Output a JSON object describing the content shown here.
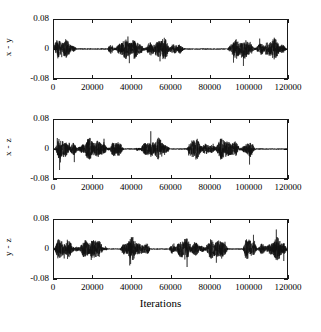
{
  "figure": {
    "background": "#ffffff",
    "trace_color": "#111111",
    "axis_color": "#1a1a1a",
    "xlabel": "Iterations"
  },
  "chart_data": {
    "type": "line",
    "title": "",
    "xlabel": "Iterations",
    "ylabel": "",
    "xlim": [
      0,
      120000
    ],
    "ylim": [
      -0.08,
      0.08
    ],
    "grid": false,
    "legend": "none",
    "xticks": [
      0,
      20000,
      40000,
      60000,
      80000,
      100000,
      120000
    ],
    "xticklabels": [
      "0",
      "20000",
      "40000",
      "60000",
      "80000",
      "100000",
      "120000"
    ],
    "yticks": [
      -0.08,
      0,
      0.08
    ],
    "yticklabels": [
      "-0.08",
      "0",
      "0.08"
    ],
    "panels": [
      {
        "ylabel": "x - y",
        "ylim": [
          -0.08,
          0.08
        ],
        "yticklabels": [
          "0.08",
          "0",
          "-0.08"
        ],
        "description": "synchronization error x minus y versus iterations; intermittent bursts of noise separated by near-zero quiet intervals",
        "active_intervals": [
          [
            0,
            12000
          ],
          [
            27000,
            68000
          ],
          [
            89000,
            120000
          ]
        ],
        "quiet_intervals": [
          [
            12000,
            27000
          ],
          [
            68000,
            89000
          ]
        ],
        "peak_amplitude": 0.055,
        "typical_amplitude": 0.03
      },
      {
        "ylabel": "x - z",
        "ylim": [
          -0.08,
          0.08
        ],
        "yticklabels": [
          "0.08",
          "0",
          "-0.08"
        ],
        "description": "synchronization error x minus z versus iterations; bursts with quiet gaps and a long quiet tail after 104000",
        "active_intervals": [
          [
            0,
            36000
          ],
          [
            42000,
            60000
          ],
          [
            68000,
            104000
          ]
        ],
        "quiet_intervals": [
          [
            36000,
            42000
          ],
          [
            60000,
            68000
          ],
          [
            104000,
            120000
          ]
        ],
        "peak_amplitude": 0.06,
        "typical_amplitude": 0.03
      },
      {
        "ylabel": "y - z",
        "ylim": [
          -0.08,
          0.08
        ],
        "yticklabels": [
          "0.08",
          "0",
          "-0.08"
        ],
        "description": "synchronization error y minus z versus iterations; bursts with quiet gaps around 28000-34000, 50000-59000 and 90000-97000",
        "active_intervals": [
          [
            0,
            28000
          ],
          [
            34000,
            50000
          ],
          [
            59000,
            90000
          ],
          [
            97000,
            120000
          ]
        ],
        "quiet_intervals": [
          [
            28000,
            34000
          ],
          [
            50000,
            59000
          ],
          [
            90000,
            97000
          ]
        ],
        "peak_amplitude": 0.06,
        "typical_amplitude": 0.03
      }
    ]
  }
}
